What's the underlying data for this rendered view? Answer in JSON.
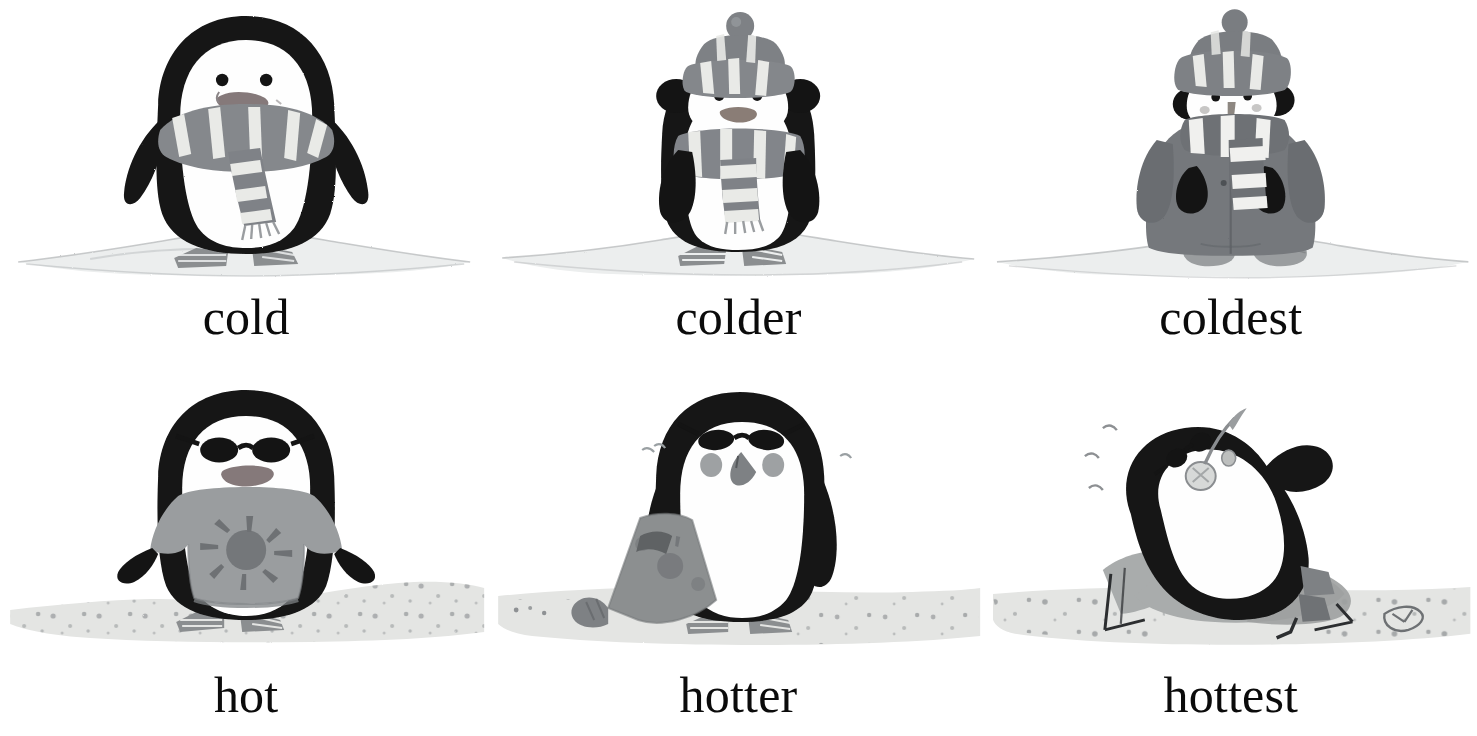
{
  "page": {
    "background_color": "#ffffff",
    "layout": "2 rows x 3 columns of illustrated penguins with word captions",
    "caption_color": "#0b0b0b"
  },
  "palette": {
    "ink_black": "#111111",
    "penguin_black": "#141414",
    "penguin_white": "#fefefe",
    "beak_gray": "#7a7a7a",
    "beak_dark": "#5f5f5f",
    "knit_gray": "#818488",
    "knit_light": "#e9e9e7",
    "knit_dark": "#6a6d71",
    "coat_gray": "#75787c",
    "coat_dark": "#5e6165",
    "snow_gray": "#e6e8e8",
    "snow_edge": "#b9bcbd",
    "sand_gray": "#e4e5e3",
    "sand_speck": "#8d9093",
    "shirt_gray": "#9a9d9f",
    "shirt_dark": "#6e7174",
    "towel_gray": "#8c8f90",
    "chair_gray": "#a9acac",
    "chair_dark": "#84878a"
  },
  "cells": [
    {
      "id": "cold",
      "caption": "cold",
      "row": "top",
      "scene": "snow",
      "description": "penguin standing on snow wearing a striped scarf",
      "items": [
        "striped-scarf"
      ],
      "icon": "penguin-cold-icon"
    },
    {
      "id": "colder",
      "caption": "colder",
      "row": "top",
      "scene": "snow",
      "description": "penguin on snow wearing a striped bobble hat, earmuffs and a long striped scarf",
      "items": [
        "bobble-hat",
        "striped-scarf",
        "earmuffs"
      ],
      "icon": "penguin-colder-icon"
    },
    {
      "id": "coldest",
      "caption": "coldest",
      "row": "top",
      "scene": "snow",
      "description": "penguin on snow bundled in a long coat, boots, hat, earmuffs and striped scarf",
      "items": [
        "bobble-hat",
        "striped-scarf",
        "earmuffs",
        "long-coat",
        "boots"
      ],
      "icon": "penguin-coldest-icon"
    },
    {
      "id": "hot",
      "caption": "hot",
      "row": "bottom",
      "scene": "sand",
      "description": "penguin on sand wearing sunglasses and a t-shirt with a sun print",
      "items": [
        "sunglasses",
        "sun-tshirt"
      ],
      "icon": "penguin-hot-icon"
    },
    {
      "id": "hotter",
      "caption": "hotter",
      "row": "bottom",
      "scene": "sand",
      "description": "penguin on sand wearing sunglasses, holding a rolled beach towel",
      "items": [
        "sunglasses",
        "beach-towel"
      ],
      "icon": "penguin-hotter-icon"
    },
    {
      "id": "hottest",
      "caption": "hottest",
      "row": "bottom",
      "scene": "sand",
      "description": "penguin lying back on a deck chair with sunglasses and a cold drink",
      "items": [
        "sunglasses",
        "deck-chair",
        "cold-drink",
        "flip-flop"
      ],
      "icon": "penguin-hottest-icon"
    }
  ]
}
